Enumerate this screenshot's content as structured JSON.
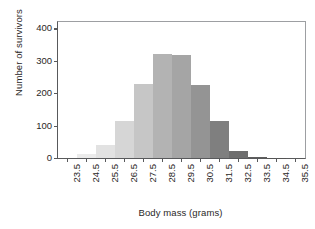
{
  "chart_data": {
    "type": "bar",
    "title": "",
    "subtitle": "",
    "xlabel": "Body mass (grams)",
    "ylabel": "Number of survivors",
    "categories": [
      "23.5",
      "24.5",
      "25.5",
      "26.5",
      "27.5",
      "28.5",
      "29.5",
      "30.5",
      "31.5",
      "32.5",
      "33.5",
      "34.5",
      "35.5"
    ],
    "values": [
      0,
      11,
      40,
      115,
      230,
      320,
      317,
      225,
      113,
      23,
      3,
      1,
      0
    ],
    "bar_colors": [
      "#f2f2f2",
      "#ebebeb",
      "#e2e2e2",
      "#d6d6d6",
      "#c6c6c6",
      "#b3b3b3",
      "#a5a5a5",
      "#949494",
      "#7f7f7f",
      "#6e6e6e",
      "#5e5e5e",
      "#545454",
      "#4a4a4a"
    ],
    "xlim": [
      23.0,
      36.0
    ],
    "ylim": [
      0,
      420
    ],
    "yticks": [
      0,
      100,
      200,
      300,
      400
    ],
    "ytick_labels": [
      "0",
      "100",
      "200",
      "300",
      "400"
    ],
    "xtick_labels": [
      "23.5",
      "24.5",
      "25.5",
      "26.5",
      "27.5",
      "28.5",
      "29.5",
      "30.5",
      "31.5",
      "32.5",
      "33.5",
      "34.5",
      "35.5"
    ],
    "grid": false,
    "legend": "none",
    "bin_width": 1.0,
    "axis_color": "#58595b"
  }
}
